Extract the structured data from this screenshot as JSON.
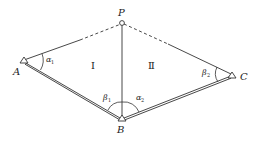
{
  "diagram": {
    "type": "surveying-intersection-figure",
    "points": [
      {
        "id": "P",
        "label": "P",
        "marker": "circle",
        "role": "unknown point"
      },
      {
        "id": "A",
        "label": "A",
        "marker": "triangle",
        "role": "known control point"
      },
      {
        "id": "B",
        "label": "B",
        "marker": "triangle",
        "role": "known control point"
      },
      {
        "id": "C",
        "label": "C",
        "marker": "triangle",
        "role": "known control point"
      }
    ],
    "edges": [
      {
        "from": "A",
        "to": "P",
        "style": "solid-then-dashed"
      },
      {
        "from": "P",
        "to": "C",
        "style": "dashed-then-solid"
      },
      {
        "from": "P",
        "to": "B",
        "style": "solid"
      },
      {
        "from": "A",
        "to": "B",
        "style": "double"
      },
      {
        "from": "B",
        "to": "C",
        "style": "double"
      }
    ],
    "regions": [
      {
        "id": "I",
        "label": "Ⅰ"
      },
      {
        "id": "II",
        "label": "Ⅱ"
      }
    ],
    "angles": [
      {
        "id": "alpha1",
        "symbol": "α",
        "subscript": "1",
        "vertex": "A"
      },
      {
        "id": "beta1",
        "symbol": "β",
        "subscript": "1",
        "vertex": "B"
      },
      {
        "id": "alpha2",
        "symbol": "α",
        "subscript": "2",
        "vertex": "B"
      },
      {
        "id": "beta2",
        "symbol": "β",
        "subscript": "2",
        "vertex": "C"
      }
    ],
    "colors": {
      "stroke": "#333333",
      "background": "#ffffff"
    }
  }
}
